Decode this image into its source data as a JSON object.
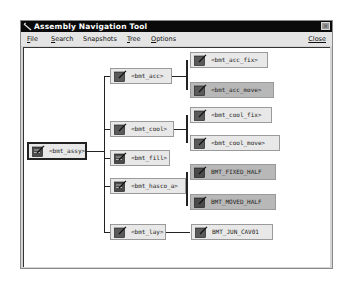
{
  "window": {
    "title": "Assembly Navigation Tool",
    "close_glyph": "×"
  },
  "menu": {
    "items": [
      {
        "label": "File",
        "ul": "F",
        "rest": "ile"
      },
      {
        "label": "Search",
        "ul": "S",
        "rest": "earch"
      },
      {
        "label": "Snapshots",
        "ul": "S",
        "pre": "",
        "rest": "napshots"
      },
      {
        "label": "Tree",
        "ul": "T",
        "rest": "ree"
      },
      {
        "label": "Options",
        "ul": "O",
        "rest": "ptions"
      }
    ],
    "close_label": "Close"
  },
  "tree": {
    "root": {
      "label": "<bmt_assy>"
    },
    "level1": [
      {
        "label": "<bmt_acc>"
      },
      {
        "label": "<bmt_cool>"
      },
      {
        "label": "<bmt_fill>"
      },
      {
        "label": "<bmt_hasco_a>"
      },
      {
        "label": "<bmt_lay>"
      }
    ],
    "level2": [
      {
        "label": "<bmt_acc_fix>",
        "parent": "<bmt_acc>",
        "shaded": false
      },
      {
        "label": "<bmt_acc_move>",
        "parent": "<bmt_acc>",
        "shaded": true
      },
      {
        "label": "<bmt_cool_fix>",
        "parent": "<bmt_cool>",
        "shaded": false
      },
      {
        "label": "<bmt_cool_move>",
        "parent": "<bmt_cool>",
        "shaded": false
      },
      {
        "label": "BMT_FIXED_HALF",
        "parent": "<bmt_hasco_a>",
        "shaded": true
      },
      {
        "label": "BMT_MOVED_HALF",
        "parent": "<bmt_hasco_a>",
        "shaded": true
      },
      {
        "label": "BMT_JUN_CAV01",
        "parent": "<bmt_lay>",
        "shaded": false
      }
    ]
  },
  "icons": {
    "node": "edit-part-icon",
    "app": "app-logo-icon"
  }
}
